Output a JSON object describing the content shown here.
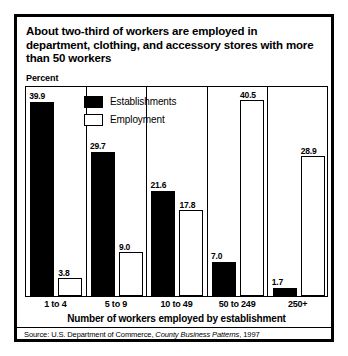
{
  "chart_data": {
    "type": "bar",
    "title": "About two-third of workers are employed in department, clothing, and accessory stores with more than 50 workers",
    "xlabel": "Number of workers employed by establishment",
    "ylabel": "Percent",
    "ylim": [
      0,
      43.5
    ],
    "grid": false,
    "legend_position": "inside-top-left",
    "categories": [
      "1 to 4",
      "5 to 9",
      "10 to 49",
      "50 to 249",
      "250+"
    ],
    "series": [
      {
        "name": "Establishments",
        "color": "#000000",
        "style": "filled",
        "values": [
          39.9,
          29.7,
          21.6,
          7.0,
          1.7
        ]
      },
      {
        "name": "Employment",
        "color": "#ffffff",
        "style": "outlined",
        "values": [
          3.8,
          9.0,
          17.8,
          40.5,
          28.9
        ]
      }
    ],
    "value_labels": [
      [
        "39.9",
        "3.8"
      ],
      [
        "29.7",
        "9.0"
      ],
      [
        "21.6",
        "17.8"
      ],
      [
        "7.0",
        "40.5"
      ],
      [
        "1.7",
        "28.9"
      ]
    ],
    "source": {
      "prefix": "Source: U.S. Department of Commerce, ",
      "italic": "County Business Patterns",
      "suffix": ", 1997"
    }
  }
}
